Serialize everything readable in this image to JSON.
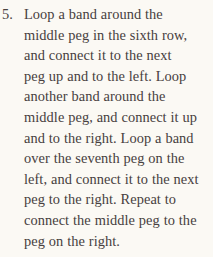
{
  "page": {
    "background_color": "#fbf9f4",
    "ink_color": "#474040"
  },
  "list_item": {
    "marker": "5.",
    "full_text": "Loop a band around the middle peg in the sixth row, and connect it to the next peg up and to the left. Loop another band around the middle peg, and connect it up and to the right. Loop a band over the seventh peg on the left, and connect it to the next peg to the right. Repeat to connect the middle peg to the peg on the right.",
    "lines": [
      "Loop a band around the",
      "middle peg in the sixth row,",
      "and connect it to the next",
      "peg up and to the left. Loop",
      "another band around the",
      "middle peg, and connect it up",
      "and to the right. Loop a band",
      "over the seventh peg on the",
      "left, and connect it to the next",
      "peg to the right. Repeat to",
      "connect the middle peg to the",
      "peg on the right."
    ]
  }
}
